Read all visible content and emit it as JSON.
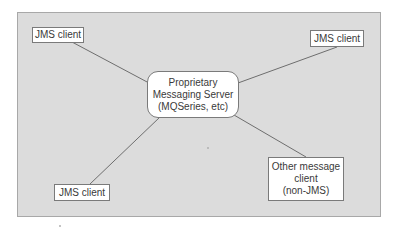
{
  "diagram": {
    "type": "hub-and-spoke",
    "background_color": "#dcdcdc",
    "line_color": "#6e6e6e",
    "hub": {
      "id": "server",
      "lines": [
        "Proprietary",
        "Messaging Server",
        "(MQSeries, etc)"
      ]
    },
    "nodes": [
      {
        "id": "jms-top-left",
        "lines": [
          "JMS client"
        ]
      },
      {
        "id": "jms-top-right",
        "lines": [
          "JMS client"
        ]
      },
      {
        "id": "jms-bottom-left",
        "lines": [
          "JMS client"
        ]
      },
      {
        "id": "other-client",
        "lines": [
          "Other message",
          "client",
          "(non-JMS)"
        ]
      }
    ],
    "edges": [
      {
        "from": "jms-top-left",
        "to": "server"
      },
      {
        "from": "jms-top-right",
        "to": "server"
      },
      {
        "from": "jms-bottom-left",
        "to": "server"
      },
      {
        "from": "other-client",
        "to": "server"
      }
    ]
  }
}
